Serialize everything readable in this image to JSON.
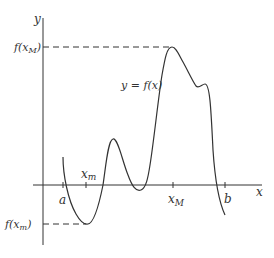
{
  "diagram": {
    "axes": {
      "x_label": "x",
      "y_label": "y"
    },
    "curve_label": "y = f(x)",
    "x_ticks": {
      "a": "a",
      "x_m": "x",
      "x_m_sub": "m",
      "x_M": "x",
      "x_M_sub": "M",
      "b": "b"
    },
    "y_levels": {
      "max_label_prefix": "f(x",
      "max_label_sub": "M",
      "max_label_suffix": ")",
      "min_label_prefix": "f(x",
      "min_label_sub": "m",
      "min_label_suffix": ")"
    },
    "colors": {
      "line": "#333333",
      "background": "#ffffff"
    }
  }
}
